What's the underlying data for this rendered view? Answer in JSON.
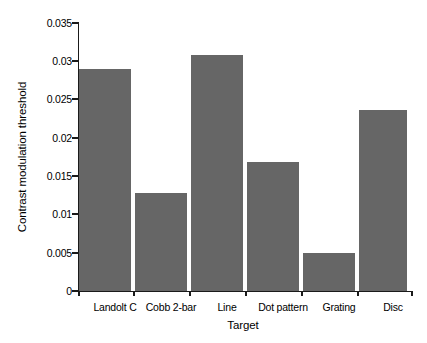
{
  "chart_data": {
    "type": "bar",
    "title": "",
    "subtitle": "",
    "xlabel": "Target",
    "ylabel": "Contrast modulation threshold",
    "categories": [
      "Landolt C",
      "Cobb 2-bar",
      "Line",
      "Dot pattern",
      "Grating",
      "Disc"
    ],
    "values": [
      0.029,
      0.0128,
      0.0308,
      0.0168,
      0.005,
      0.0237
    ],
    "series": [
      {
        "name": "Contrast modulation threshold",
        "values": [
          0.029,
          0.0128,
          0.0308,
          0.0168,
          0.005,
          0.0237
        ]
      }
    ],
    "ylim": [
      0,
      0.035
    ],
    "yticks": [
      0,
      0.005,
      0.01,
      0.015,
      0.02,
      0.025,
      0.03,
      0.035
    ],
    "ytick_labels": [
      "0",
      "0.005",
      "0.01",
      "0.015",
      "0.02",
      "0.025",
      "0.03",
      "0.035"
    ],
    "grid": false,
    "legend": false,
    "legend_position": "none",
    "bar_color": "#666666",
    "axis_color": "#1a1a1a",
    "background_color": "#ffffff"
  }
}
